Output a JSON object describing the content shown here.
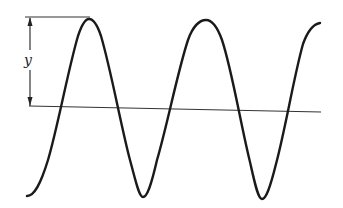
{
  "diagram": {
    "title": "",
    "amplitude_label": "y",
    "colors": {
      "stroke": "#1a1a1a",
      "axis": "#333333",
      "background": "#ffffff"
    },
    "wave": {
      "cycles_visible": 2.5,
      "crests": 2,
      "troughs": 3
    }
  }
}
